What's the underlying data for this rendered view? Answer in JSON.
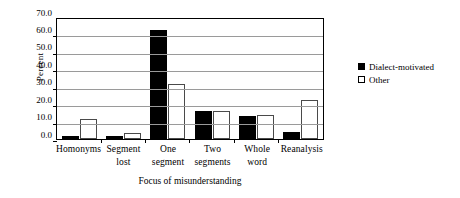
{
  "chart_data": {
    "type": "bar",
    "title": "",
    "xlabel": "Focus of misunderstanding",
    "ylabel": "Percent",
    "categories": [
      [
        "Homonyms"
      ],
      [
        "Segment",
        "lost"
      ],
      [
        "One",
        "segment"
      ],
      [
        "Two",
        "segments"
      ],
      [
        "Whole",
        "word"
      ],
      [
        "Reanalysis"
      ]
    ],
    "series": [
      {
        "name": "Dialect-motivated",
        "color": "#000000",
        "style": "filled",
        "values": [
          1.8,
          2.0,
          62.5,
          15.8,
          13.3,
          4.1
        ]
      },
      {
        "name": "Other",
        "color": "#ffffff",
        "style": "hollow",
        "values": [
          11.2,
          3.4,
          31.3,
          15.8,
          14.0,
          22.4
        ]
      }
    ],
    "ylim": [
      0.0,
      70.0
    ],
    "ytick_step": 10.0,
    "yticks": [
      "70.0",
      "60.0",
      "50.0",
      "40.0",
      "30.0",
      "20.0",
      "10.0",
      "0.0"
    ],
    "ytick_values": [
      70.0,
      60.0,
      50.0,
      40.0,
      30.0,
      20.0,
      10.0,
      0.0
    ],
    "grid": "horizontal",
    "legend_position": "right"
  }
}
